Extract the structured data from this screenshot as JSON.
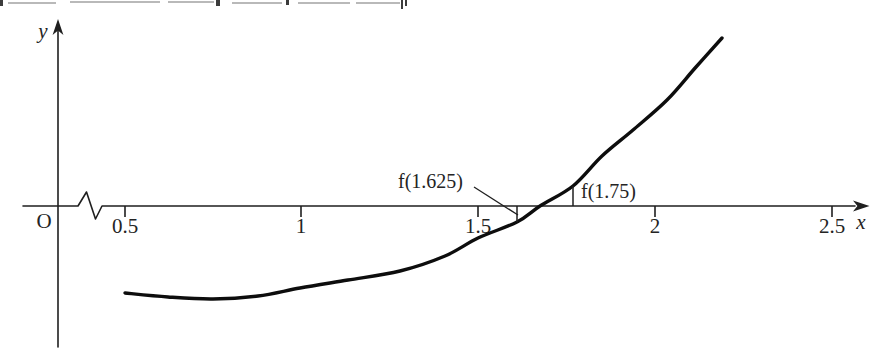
{
  "figure": {
    "background_color": "#ffffff",
    "ink_color": "#1f1f1f",
    "curve_color": "#0d0d0d",
    "y_axis_label": "y",
    "x_axis_label": "x",
    "origin_label": "O",
    "annotation_left": "f(1.625)",
    "annotation_right": "f(1.75)",
    "x_ticks": [
      {
        "label": "0.5",
        "px": 125
      },
      {
        "label": "1",
        "px": 301
      },
      {
        "label": "1.5",
        "px": 478
      },
      {
        "label": "2",
        "px": 655
      },
      {
        "label": "2.5",
        "px": 832
      }
    ]
  },
  "chart_data": {
    "type": "line",
    "title": "",
    "xlabel": "x",
    "ylabel": "y",
    "x_ticks": [
      0.5,
      1,
      1.5,
      2,
      2.5
    ],
    "x_range_shown": [
      0,
      2.6
    ],
    "axis_break_between": [
      0,
      0.5
    ],
    "y_axis_ticks": "none (y scale unlabeled)",
    "grid": false,
    "legend": false,
    "curve_root_x": 1.68,
    "annotations": [
      {
        "text": "f(1.625)",
        "x": 1.625,
        "value_sign": "negative",
        "drawn_as": "short vertical segment below x-axis, pointed to by leader line from label"
      },
      {
        "text": "f(1.75)",
        "x": 1.75,
        "value_sign": "positive",
        "drawn_as": "short vertical segment above x-axis beside label"
      }
    ],
    "series": [
      {
        "name": "y = f(x)",
        "x": [
          0.5,
          0.62,
          0.75,
          0.88,
          1.0,
          1.13,
          1.28,
          1.41,
          1.5,
          1.61,
          1.675,
          1.77,
          1.85,
          1.94,
          2.03,
          2.12,
          2.19
        ],
        "y_arbitrary_units": [
          -0.87,
          -0.91,
          -0.93,
          -0.9,
          -0.82,
          -0.74,
          -0.65,
          -0.5,
          -0.32,
          -0.16,
          0,
          0.2,
          0.5,
          0.76,
          1.06,
          1.39,
          1.68
        ]
      }
    ],
    "curve_px": [
      [
        125,
        293
      ],
      [
        168,
        297
      ],
      [
        213,
        299
      ],
      [
        258,
        296
      ],
      [
        300,
        288
      ],
      [
        348,
        280
      ],
      [
        400,
        271
      ],
      [
        445,
        256
      ],
      [
        478,
        238
      ],
      [
        517,
        222
      ],
      [
        540,
        206
      ],
      [
        573,
        186
      ],
      [
        602,
        156
      ],
      [
        633,
        130
      ],
      [
        667,
        100
      ],
      [
        696,
        67
      ],
      [
        722,
        38
      ]
    ]
  }
}
